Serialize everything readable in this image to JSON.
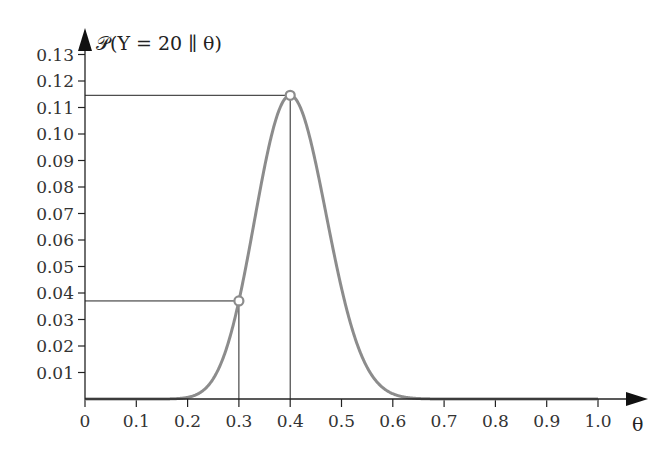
{
  "chart_data": {
    "type": "line",
    "title": "𝒫(Y = 20 ∥ θ)",
    "xlabel": "θ",
    "ylabel": "𝒫(Y = 20 ∥ θ)",
    "xlim": [
      0,
      1.0
    ],
    "ylim": [
      0,
      0.13
    ],
    "grid": false,
    "legend": null,
    "x_ticks": [
      "0",
      "0.1",
      "0.2",
      "0.3",
      "0.4",
      "0.5",
      "0.6",
      "0.7",
      "0.8",
      "0.9",
      "1.0"
    ],
    "y_ticks": [
      "0.01",
      "0.02",
      "0.03",
      "0.04",
      "0.05",
      "0.06",
      "0.07",
      "0.08",
      "0.09",
      "0.10",
      "0.11",
      "0.12",
      "0.13"
    ],
    "series": [
      {
        "name": "Binomial likelihood n=50, y=20",
        "color": "#8c8c8c",
        "n": 50,
        "k": 20,
        "x": [
          0,
          0.1,
          0.15,
          0.2,
          0.25,
          0.3,
          0.35,
          0.4,
          0.45,
          0.5,
          0.55,
          0.6,
          0.65,
          0.7,
          0.8,
          0.9,
          1.0
        ],
        "y": [
          0,
          0.0,
          0.0004,
          0.003,
          0.0139,
          0.037,
          0.0733,
          0.1146,
          0.1023,
          0.0419,
          0.0133,
          0.002,
          0.0002,
          0.0,
          0,
          0,
          0
        ]
      }
    ],
    "annotations": [
      {
        "label": "marker at θ=0.3",
        "x": 0.3,
        "y": 0.037
      },
      {
        "label": "marker at θ=0.4 (max)",
        "x": 0.4,
        "y": 0.1146
      }
    ]
  }
}
